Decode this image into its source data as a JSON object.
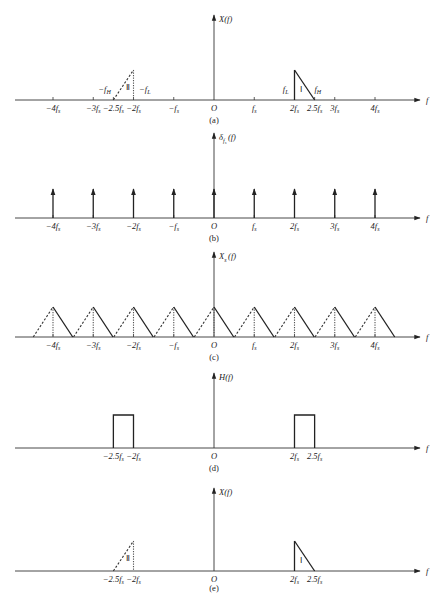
{
  "figure": {
    "scale": {
      "origin_x": 214,
      "fs_px": 40.25,
      "axis_start_x": 15,
      "axis_end_x": 420
    },
    "panels": [
      {
        "id": "a",
        "caption": "(a)",
        "ylabel": "X(f)",
        "ylabel_sub": "",
        "xlabel": "f",
        "origin_label": "O",
        "baseline_y": 100,
        "yaxis_top": 15,
        "ticks": [
          {
            "k": -4,
            "label": "−4f",
            "sub": "s"
          },
          {
            "k": -3,
            "label": "−3f",
            "sub": "s"
          },
          {
            "k": -2.5,
            "label": "−2.5f",
            "sub": "s"
          },
          {
            "k": -2,
            "label": "−2f",
            "sub": "s"
          },
          {
            "k": -1,
            "label": "−f",
            "sub": "s"
          },
          {
            "k": 1,
            "label": "f",
            "sub": "s"
          },
          {
            "k": 2,
            "label": "2f",
            "sub": "s"
          },
          {
            "k": 2.5,
            "label": "2.5f",
            "sub": "s"
          },
          {
            "k": 3,
            "label": "3f",
            "sub": "s"
          },
          {
            "k": 4,
            "label": "4f",
            "sub": "s"
          }
        ],
        "annotations": [
          {
            "text": "−f",
            "sub": "H",
            "k": -2.72,
            "dy": -8
          },
          {
            "text": "−f",
            "sub": "L",
            "k": -1.72,
            "dy": -8
          },
          {
            "text": "f",
            "sub": "L",
            "k": 1.78,
            "dy": -8
          },
          {
            "text": "f",
            "sub": "H",
            "k": 2.58,
            "dy": -8
          }
        ],
        "bands": [
          {
            "kind": "neg",
            "from": -2.5,
            "to": -2,
            "height": 30,
            "roman": "Ⅱ"
          },
          {
            "kind": "pos",
            "from": 2,
            "to": 2.5,
            "height": 30,
            "roman": "Ⅰ"
          }
        ]
      },
      {
        "id": "b",
        "caption": "(b)",
        "ylabel": "δ",
        "ylabel_sub": "f",
        "ylabel_subsub": "s",
        "ylabel_tail": "(f)",
        "xlabel": "f",
        "origin_label": "O",
        "baseline_y": 218,
        "yaxis_top": 133,
        "impulse_height": 29,
        "impulses": [
          -4,
          -3,
          -2,
          -1,
          0,
          1,
          2,
          3,
          4
        ],
        "ticks": [
          {
            "k": -4,
            "label": "−4f",
            "sub": "s"
          },
          {
            "k": -3,
            "label": "−3f",
            "sub": "s"
          },
          {
            "k": -2,
            "label": "−2f",
            "sub": "s"
          },
          {
            "k": -1,
            "label": "−f",
            "sub": "s"
          },
          {
            "k": 1,
            "label": "f",
            "sub": "s"
          },
          {
            "k": 2,
            "label": "2f",
            "sub": "s"
          },
          {
            "k": 3,
            "label": "3f",
            "sub": "s"
          },
          {
            "k": 4,
            "label": "4f",
            "sub": "s"
          }
        ]
      },
      {
        "id": "c",
        "caption": "(c)",
        "ylabel": "X",
        "ylabel_sub": "s",
        "ylabel_tail": "(f)",
        "xlabel": "f",
        "origin_label": "O",
        "baseline_y": 337,
        "yaxis_top": 252,
        "replica_height": 30,
        "replicas": [
          -4,
          -3,
          -2,
          -1,
          0,
          1,
          2,
          3,
          4
        ],
        "ticks": [
          {
            "k": -4,
            "label": "−4f",
            "sub": "s"
          },
          {
            "k": -3,
            "label": "−3f",
            "sub": "s"
          },
          {
            "k": -2,
            "label": "−2f",
            "sub": "s"
          },
          {
            "k": -1,
            "label": "−f",
            "sub": "s"
          },
          {
            "k": 1,
            "label": "f",
            "sub": "s"
          },
          {
            "k": 2,
            "label": "2f",
            "sub": "s"
          },
          {
            "k": 3,
            "label": "3f",
            "sub": "s"
          },
          {
            "k": 4,
            "label": "4f",
            "sub": "s"
          }
        ]
      },
      {
        "id": "d",
        "caption": "(d)",
        "ylabel": "H(f)",
        "ylabel_sub": "",
        "xlabel": "f",
        "origin_label": "O",
        "baseline_y": 448,
        "yaxis_top": 373,
        "rects": [
          {
            "from": -2.5,
            "to": -2,
            "height": 33
          },
          {
            "from": 2,
            "to": 2.5,
            "height": 33
          }
        ],
        "ticks": [
          {
            "k": -2.5,
            "label": "−2.5f",
            "sub": "s",
            "tick": false
          },
          {
            "k": -2,
            "label": "−2f",
            "sub": "s",
            "tick": false
          },
          {
            "k": 2,
            "label": "2f",
            "sub": "s",
            "tick": false
          },
          {
            "k": 2.5,
            "label": "2.5f",
            "sub": "s",
            "tick": false
          }
        ]
      },
      {
        "id": "e",
        "caption": "(e)",
        "ylabel": "X(f)",
        "ylabel_sub": "",
        "xlabel": "f",
        "origin_label": "O",
        "baseline_y": 571,
        "yaxis_top": 488,
        "bands": [
          {
            "kind": "neg",
            "from": -2.5,
            "to": -2,
            "height": 30,
            "roman": "Ⅱ"
          },
          {
            "kind": "pos",
            "from": 2,
            "to": 2.5,
            "height": 30,
            "roman": "Ⅰ"
          }
        ],
        "ticks": [
          {
            "k": -2.5,
            "label": "−2.5f",
            "sub": "s",
            "tick": false
          },
          {
            "k": -2,
            "label": "−2f",
            "sub": "s",
            "tick": false
          },
          {
            "k": 2,
            "label": "2f",
            "sub": "s",
            "tick": false
          },
          {
            "k": 2.5,
            "label": "2.5f",
            "sub": "s",
            "tick": false
          }
        ]
      }
    ]
  }
}
